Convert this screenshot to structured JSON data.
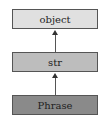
{
  "diagram": {
    "type": "inheritance",
    "nodes": [
      {
        "id": "object",
        "label": "object",
        "fill": "#e0e0e0"
      },
      {
        "id": "str",
        "label": "str",
        "fill": "#bdbdbd"
      },
      {
        "id": "phrase",
        "label": "Phrase",
        "fill": "#8a8a8a"
      }
    ],
    "edges": [
      {
        "from": "str",
        "to": "object"
      },
      {
        "from": "phrase",
        "to": "str"
      }
    ]
  }
}
